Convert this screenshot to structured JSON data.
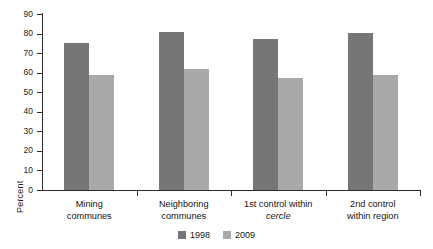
{
  "chart_data": {
    "type": "bar",
    "title": "",
    "subtitle": "",
    "xlabel": "",
    "ylabel": "Percent",
    "ylim": [
      0,
      90
    ],
    "ytick_step": 10,
    "yticks": [
      "90",
      "80",
      "70",
      "60",
      "50",
      "40",
      "30",
      "20",
      "10",
      "0"
    ],
    "grid": false,
    "legend_position": "bottom-center",
    "categories": [
      "Mining communes",
      "Neighboring communes",
      "1st control within cercle",
      "2nd control within region"
    ],
    "category_lines": [
      [
        "Mining",
        "communes"
      ],
      [
        "Neighboring",
        "communes"
      ],
      [
        "1st control within",
        "cercle"
      ],
      [
        "2nd control",
        "within region"
      ]
    ],
    "series": [
      {
        "name": "1998",
        "color": "#767676",
        "values": [
          75,
          81,
          77,
          80.5
        ]
      },
      {
        "name": "2009",
        "color": "#a9a9a9",
        "values": [
          59,
          62,
          57.5,
          59
        ]
      }
    ]
  },
  "axis": {
    "line_color": "#2b2b2b"
  }
}
